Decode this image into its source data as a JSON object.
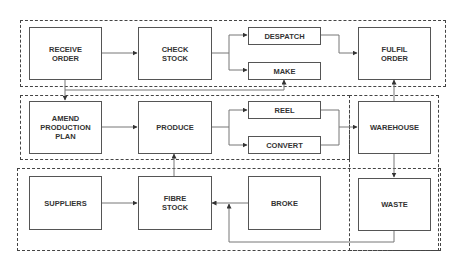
{
  "diagram": {
    "type": "process-flow",
    "groups": [
      {
        "id": "order-group",
        "nodes": [
          "receive_order",
          "check_stock",
          "despatch",
          "make",
          "fulfil_order"
        ]
      },
      {
        "id": "production-group",
        "nodes": [
          "amend_production_plan",
          "produce",
          "reel",
          "convert"
        ]
      },
      {
        "id": "warehouse-group",
        "nodes": [
          "warehouse",
          "waste"
        ]
      },
      {
        "id": "supply-group",
        "nodes": [
          "suppliers",
          "fibre_stock",
          "broke"
        ]
      }
    ],
    "nodes": {
      "receive_order": "RECEIVE\nORDER",
      "check_stock": "CHECK\nSTOCK",
      "despatch": "DESPATCH",
      "make": "MAKE",
      "fulfil_order": "FULFIL\nORDER",
      "amend_production_plan": "AMEND\nPRODUCTION\nPLAN",
      "produce": "PRODUCE",
      "reel": "REEL",
      "convert": "CONVERT",
      "warehouse": "WAREHOUSE",
      "waste": "WASTE",
      "suppliers": "SUPPLIERS",
      "fibre_stock": "FIBRE\nSTOCK",
      "broke": "BROKE"
    },
    "edges": [
      {
        "from": "RECEIVE ORDER",
        "to": "CHECK STOCK"
      },
      {
        "from": "CHECK STOCK",
        "to": "DESPATCH"
      },
      {
        "from": "CHECK STOCK",
        "to": "MAKE"
      },
      {
        "from": "DESPATCH",
        "to": "FULFIL ORDER"
      },
      {
        "from": "RECEIVE ORDER",
        "to": "AMEND PRODUCTION PLAN"
      },
      {
        "from": "RECEIVE ORDER",
        "to": "MAKE"
      },
      {
        "from": "AMEND PRODUCTION PLAN",
        "to": "PRODUCE"
      },
      {
        "from": "PRODUCE",
        "to": "REEL"
      },
      {
        "from": "PRODUCE",
        "to": "CONVERT"
      },
      {
        "from": "REEL",
        "to": "WAREHOUSE"
      },
      {
        "from": "CONVERT",
        "to": "WAREHOUSE"
      },
      {
        "from": "WAREHOUSE",
        "to": "FULFIL ORDER"
      },
      {
        "from": "WAREHOUSE",
        "to": "WASTE"
      },
      {
        "from": "SUPPLIERS",
        "to": "FIBRE STOCK"
      },
      {
        "from": "FIBRE STOCK",
        "to": "PRODUCE"
      },
      {
        "from": "BROKE",
        "to": "FIBRE STOCK"
      },
      {
        "from": "WASTE",
        "to": "FIBRE STOCK"
      }
    ]
  }
}
